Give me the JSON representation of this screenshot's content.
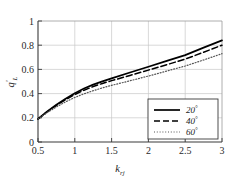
{
  "chart_data": {
    "type": "line",
    "title": "",
    "xlabel": "k_rj",
    "xlabel_base": "k",
    "xlabel_sub": "rj",
    "ylabel": "q'_L",
    "ylabel_base": "q",
    "ylabel_prime": "′",
    "ylabel_sub": "L",
    "xlim": [
      0.5,
      3
    ],
    "ylim": [
      0,
      1
    ],
    "xticks": [
      0.5,
      1,
      1.5,
      2,
      2.5,
      3
    ],
    "xtick_labels": [
      "0.5",
      "1",
      "1.5",
      "2",
      "2.5",
      "3"
    ],
    "yticks": [
      0,
      0.2,
      0.4,
      0.6,
      0.8,
      1
    ],
    "ytick_labels": [
      "0",
      "0.2",
      "0.4",
      "0.6",
      "0.8",
      "1"
    ],
    "grid": true,
    "grid_color": "#c8c8c8",
    "axis_color": "#3a3a3a",
    "legend_position": "lower right",
    "x": [
      0.5,
      0.625,
      0.75,
      0.875,
      1.0,
      1.125,
      1.25,
      1.375,
      1.5,
      1.75,
      2.0,
      2.25,
      2.5,
      2.75,
      3.0
    ],
    "series": [
      {
        "name": "20°",
        "label": "20",
        "unit": "°",
        "style": "solid",
        "color": "#000000",
        "values": [
          0.19,
          0.253,
          0.308,
          0.358,
          0.403,
          0.442,
          0.474,
          0.501,
          0.526,
          0.574,
          0.622,
          0.67,
          0.718,
          0.78,
          0.84
        ]
      },
      {
        "name": "40°",
        "label": "40",
        "unit": "°",
        "style": "dashed",
        "color": "#000000",
        "values": [
          0.19,
          0.25,
          0.303,
          0.35,
          0.392,
          0.428,
          0.458,
          0.484,
          0.507,
          0.55,
          0.594,
          0.639,
          0.685,
          0.742,
          0.8
        ]
      },
      {
        "name": "60°",
        "label": "60",
        "unit": "°",
        "style": "dotted",
        "color": "#555555",
        "values": [
          0.19,
          0.243,
          0.29,
          0.332,
          0.368,
          0.398,
          0.424,
          0.447,
          0.468,
          0.506,
          0.545,
          0.586,
          0.628,
          0.678,
          0.73
        ]
      }
    ],
    "legend_entries": [
      {
        "label": "20",
        "unit": "°",
        "style": "solid"
      },
      {
        "label": "40",
        "unit": "°",
        "style": "dashed"
      },
      {
        "label": "60",
        "unit": "°",
        "style": "dotted"
      }
    ]
  }
}
